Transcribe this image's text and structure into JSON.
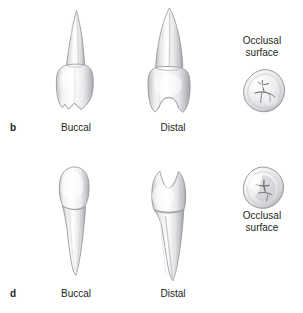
{
  "figure": {
    "panels": [
      {
        "id": "b",
        "letter": "b",
        "views": [
          {
            "id": "buccal",
            "label": "Buccal",
            "icon": "tooth-buccal-icon"
          },
          {
            "id": "distal",
            "label": "Distal",
            "icon": "tooth-distal-icon"
          },
          {
            "id": "occlusal",
            "label": "Occlusal\nsurface",
            "label_line1": "Occlusal",
            "label_line2": "surface",
            "icon": "tooth-occlusal-surface-icon"
          }
        ]
      },
      {
        "id": "d",
        "letter": "d",
        "views": [
          {
            "id": "buccal",
            "label": "Buccal",
            "icon": "tooth-buccal-icon"
          },
          {
            "id": "distal",
            "label": "Distal",
            "icon": "tooth-distal-icon"
          },
          {
            "id": "occlusal",
            "label": "Occlusal\nsurface",
            "label_line1": "Occlusal",
            "label_line2": "surface",
            "icon": "tooth-occlusal-surface-icon"
          }
        ]
      }
    ],
    "colors": {
      "background": "#ffffff",
      "text": "#231f20",
      "enamel_light": "#ffffff",
      "enamel_mid": "#e8e8ea",
      "enamel_shadow": "#b9babd",
      "outline": "#8e9094"
    }
  }
}
